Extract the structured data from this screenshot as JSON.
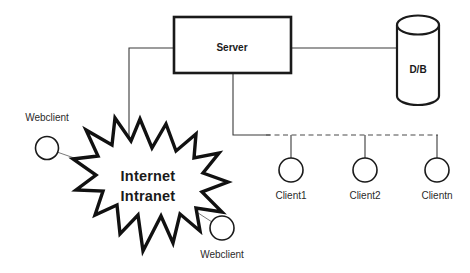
{
  "diagram": {
    "background_color": "#ffffff",
    "line_color": "#1a1a1a",
    "text_color": "#1a1a1a",
    "nodes": {
      "server": {
        "label": "Server",
        "shape": "rectangle"
      },
      "database": {
        "label": "D/B",
        "shape": "cylinder"
      },
      "network_cloud": {
        "label_line1": "Internet",
        "label_line2": "Intranet",
        "shape": "starburst"
      },
      "webclient_left": {
        "label": "Webclient",
        "shape": "circle"
      },
      "webclient_bottom": {
        "label": "Webclient",
        "shape": "circle"
      },
      "client1": {
        "label": "Client1",
        "shape": "circle"
      },
      "client2": {
        "label": "Client2",
        "shape": "circle"
      },
      "clientn": {
        "label": "Clientn",
        "shape": "circle"
      }
    },
    "connections": [
      {
        "name": "server-to-database",
        "style": "solid"
      },
      {
        "name": "server-to-network-cloud",
        "style": "solid"
      },
      {
        "name": "server-to-client-bus",
        "style": "solid"
      },
      {
        "name": "client-bus",
        "style": "dashed"
      },
      {
        "name": "bus-to-client1",
        "style": "solid"
      },
      {
        "name": "bus-to-client2",
        "style": "solid"
      },
      {
        "name": "bus-to-clientn",
        "style": "solid"
      },
      {
        "name": "webclient-left-to-cloud",
        "style": "solid"
      },
      {
        "name": "webclient-bottom-to-cloud",
        "style": "solid"
      }
    ]
  }
}
